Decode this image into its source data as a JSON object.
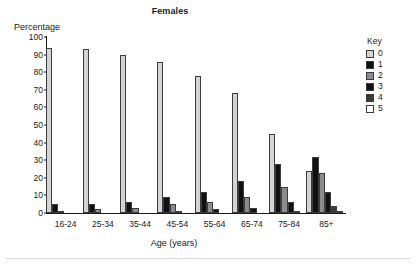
{
  "chart_data": {
    "type": "bar",
    "title": "Females",
    "xlabel": "Age (years)",
    "ylabel": "Percentage",
    "ylim": [
      0,
      100
    ],
    "ytick_step": 10,
    "yticks": [
      0,
      10,
      20,
      30,
      40,
      50,
      60,
      70,
      80,
      90,
      100
    ],
    "grid": false,
    "legend_position": "right",
    "legend_title": "Key",
    "categories": [
      "16-24",
      "25-34",
      "35-44",
      "45-54",
      "55-64",
      "65-74",
      "75-84",
      "85+"
    ],
    "series": [
      {
        "name": "0",
        "color": "#d4d4d4",
        "values": [
          94,
          93,
          90,
          86,
          78,
          68,
          45,
          24
        ]
      },
      {
        "name": "1",
        "color": "#111111",
        "values": [
          5,
          5,
          6,
          9,
          12,
          18,
          28,
          32
        ]
      },
      {
        "name": "2",
        "color": "#8c8c8c",
        "values": [
          1,
          2,
          3,
          5,
          6,
          9,
          15,
          23
        ]
      },
      {
        "name": "3",
        "color": "#111111",
        "values": [
          0,
          0,
          0,
          1,
          2,
          3,
          6,
          12
        ]
      },
      {
        "name": "4",
        "color": "#3a3a3a",
        "values": [
          0,
          0,
          0,
          0,
          0,
          0,
          1,
          4
        ]
      },
      {
        "name": "5",
        "color": "#ffffff",
        "values": [
          0,
          0,
          0,
          0,
          0,
          0,
          0,
          1
        ]
      }
    ]
  }
}
